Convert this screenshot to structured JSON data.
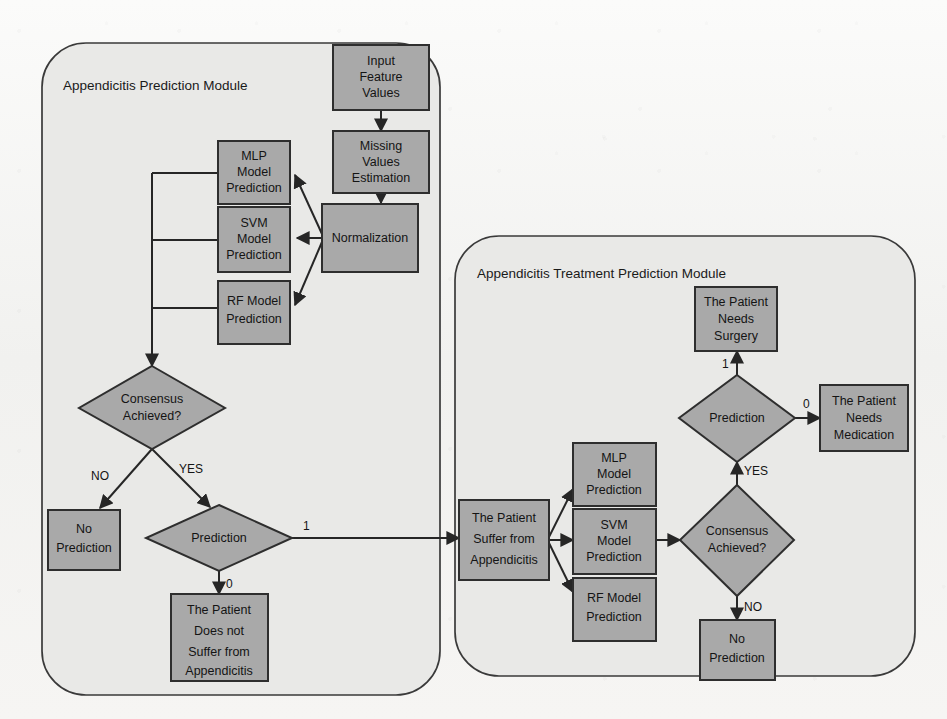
{
  "figure": {
    "kind": "flowchart",
    "background_color": "#f3f3f1",
    "node_fill": "#a9a9a9",
    "module_fill": "#e9e9e7",
    "stroke_color": "#2e2e2e"
  },
  "modules": [
    {
      "id": "prediction_module",
      "title": "Appendicitis Prediction Module"
    },
    {
      "id": "treatment_module",
      "title": "Appendicitis Treatment Prediction Module"
    }
  ],
  "left_module": {
    "title": "Appendicitis Prediction Module",
    "nodes": {
      "input_features": {
        "line1": "Input",
        "line2": "Feature",
        "line3": "Values"
      },
      "missing_values": {
        "line1": "Missing",
        "line2": "Values",
        "line3": "Estimation"
      },
      "normalization": {
        "line1": "Normalization"
      },
      "mlp": {
        "line1": "MLP",
        "line2": "Model",
        "line3": "Prediction"
      },
      "svm": {
        "line1": "SVM",
        "line2": "Model",
        "line3": "Prediction"
      },
      "rf": {
        "line1": "RF Model",
        "line2": "Prediction"
      },
      "consensus": {
        "line1": "Consensus",
        "line2": "Achieved?"
      },
      "no_prediction": {
        "line1": "No",
        "line2": "Prediction"
      },
      "prediction": {
        "line1": "Prediction"
      },
      "not_suffer": {
        "line1": "The Patient",
        "line2": "Does not",
        "line3": "Suffer from",
        "line4": "Appendicitis"
      }
    },
    "edge_labels": {
      "consensus_no": "NO",
      "consensus_yes": "YES",
      "prediction_one": "1",
      "prediction_zero": "0"
    }
  },
  "right_module": {
    "title": "Appendicitis Treatment Prediction Module",
    "nodes": {
      "suffer": {
        "line1": "The Patient",
        "line2": "Suffer from",
        "line3": "Appendicitis"
      },
      "mlp": {
        "line1": "MLP",
        "line2": "Model",
        "line3": "Prediction"
      },
      "svm": {
        "line1": "SVM",
        "line2": "Model",
        "line3": "Prediction"
      },
      "rf": {
        "line1": "RF Model",
        "line2": "Prediction"
      },
      "consensus": {
        "line1": "Consensus",
        "line2": "Achieved?"
      },
      "no_prediction": {
        "line1": "No",
        "line2": "Prediction"
      },
      "prediction": {
        "line1": "Prediction"
      },
      "needs_surgery": {
        "line1": "The Patient",
        "line2": "Needs",
        "line3": "Surgery"
      },
      "needs_medication": {
        "line1": "The Patient",
        "line2": "Needs",
        "line3": "Medication"
      }
    },
    "edge_labels": {
      "consensus_yes": "YES",
      "consensus_no": "NO",
      "prediction_one": "1",
      "prediction_zero": "0"
    }
  }
}
